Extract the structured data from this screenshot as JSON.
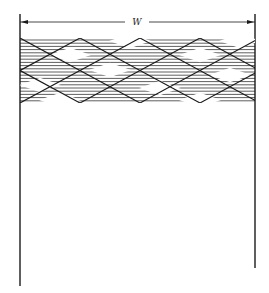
{
  "figure": {
    "dimension_label": "W",
    "colors": {
      "line": "#1a1a1a",
      "background": "#ffffff"
    },
    "channel": {
      "left_wall_x": 20,
      "right_wall_x": 255,
      "top_y": 14,
      "left_wall_bottom_y": 286,
      "right_wall_bottom_y": 268
    },
    "dimension_line": {
      "y": 22,
      "x1": 20,
      "x2": 255,
      "label_x": 137
    },
    "wave_band": {
      "top_y": 38,
      "bottom_y": 103,
      "hatch_spacing": 3.2,
      "diamond_half_width": 30,
      "rows": 4
    }
  }
}
